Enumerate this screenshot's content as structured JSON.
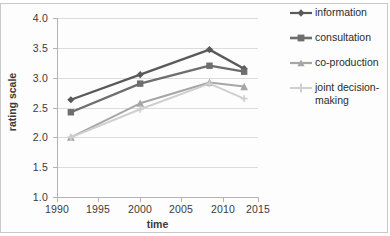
{
  "chart_data": {
    "type": "line",
    "title": "",
    "xlabel": "time",
    "ylabel": "rating scale",
    "x": [
      1990,
      2000,
      2010,
      2015
    ],
    "xticks": [
      "1990",
      "1995",
      "2000",
      "2005",
      "2010",
      "2015"
    ],
    "xlim": [
      1988,
      2017
    ],
    "yticks": [
      "1.0",
      "1.5",
      "2.0",
      "2.5",
      "3.0",
      "3.5",
      "4.0"
    ],
    "ylim": [
      1.0,
      4.0
    ],
    "grid": "horizontal",
    "legend_position": "right",
    "series": [
      {
        "name": "information",
        "marker": "diamond",
        "color": "#595959",
        "values": [
          2.63,
          3.05,
          3.47,
          3.15
        ]
      },
      {
        "name": "consultation",
        "marker": "square",
        "color": "#6e6e6e",
        "values": [
          2.42,
          2.9,
          3.2,
          3.1
        ]
      },
      {
        "name": "co-production",
        "marker": "triangle",
        "color": "#a6a6a6",
        "values": [
          2.0,
          2.57,
          2.92,
          2.85
        ]
      },
      {
        "name": "joint decision-making",
        "marker": "cross",
        "color": "#cfcfcf",
        "values": [
          2.0,
          2.47,
          2.9,
          2.65
        ]
      }
    ]
  },
  "axis": {
    "x_title": "time",
    "y_title": "rating scale",
    "y_labels": [
      "4.0",
      "3.5",
      "3.0",
      "2.5",
      "2.0",
      "1.5",
      "1.0"
    ],
    "x_labels": [
      "1990",
      "1995",
      "2000",
      "2005",
      "2010",
      "2015"
    ]
  },
  "legend": {
    "items": [
      {
        "label": "information"
      },
      {
        "label": "consultation"
      },
      {
        "label": "co-production"
      },
      {
        "label": "joint decision-making"
      }
    ]
  },
  "colors": {
    "information": "#595959",
    "consultation": "#6e6e6e",
    "co_production": "#a6a6a6",
    "joint_decision_making": "#cfcfcf",
    "gridline": "#dcdcdc",
    "axis": "#b3b3b3",
    "text": "#3a3a3a",
    "frame": "#c9c9c9"
  }
}
